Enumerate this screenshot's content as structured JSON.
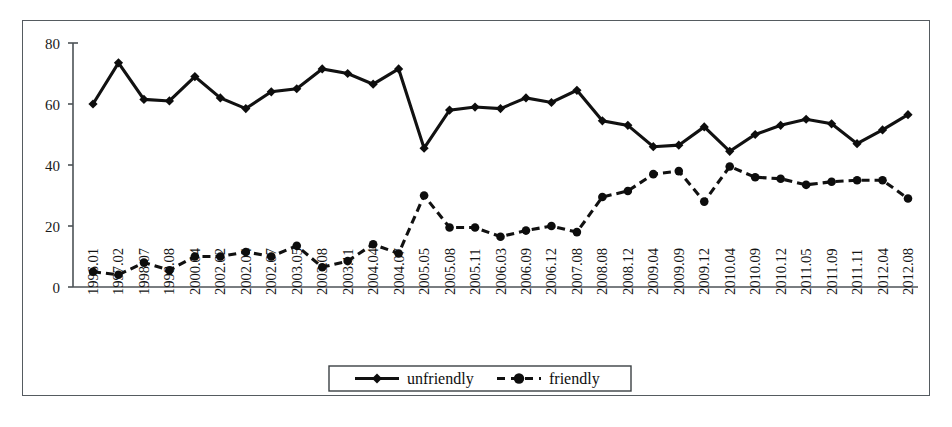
{
  "chart_data": {
    "type": "line",
    "title": "",
    "subtitle": "",
    "xlabel": "",
    "ylabel": "",
    "ylim": [
      0,
      80
    ],
    "yticks": [
      0,
      20,
      40,
      60,
      80
    ],
    "grid": false,
    "legend_position": "bottom",
    "categories": [
      "1996.01",
      "1997.02",
      "1998.07",
      "1998.08",
      "2000.04",
      "2002.02",
      "2002.04",
      "2002.07",
      "2003.05",
      "2003.08",
      "2003.11",
      "2004.04",
      "2004.07",
      "2005.05",
      "2005.08",
      "2005.11",
      "2006.03",
      "2006.09",
      "2006.12",
      "2007.08",
      "2008.08",
      "2008.12",
      "2009.04",
      "2009.09",
      "2009.12",
      "2010.04",
      "2010.09",
      "2010.12",
      "2011.05",
      "2011.09",
      "2011.11",
      "2012.04",
      "2012.08"
    ],
    "series": [
      {
        "name": "unfriendly",
        "line_style": "solid",
        "marker": "diamond",
        "color": "#111111",
        "values": [
          60,
          73.5,
          61.5,
          61,
          69,
          62,
          58.5,
          64,
          65,
          71.5,
          70,
          66.5,
          71.5,
          45.5,
          58,
          59,
          58.5,
          62,
          60.5,
          64.5,
          54.5,
          53,
          46,
          46.5,
          52.5,
          44.5,
          50,
          53,
          55,
          53.5,
          47,
          51.5,
          56.5
        ]
      },
      {
        "name": "friendly",
        "line_style": "dashed",
        "marker": "circle",
        "color": "#111111",
        "values": [
          5,
          4,
          8,
          5.5,
          10,
          10,
          11.5,
          10,
          13.5,
          6.5,
          8.5,
          14,
          11,
          30,
          19.5,
          19.5,
          16.5,
          18.5,
          20,
          18,
          29.5,
          31.5,
          37,
          38,
          28,
          39.5,
          36,
          35.5,
          33.5,
          34.5,
          35,
          35,
          29
        ]
      }
    ]
  },
  "legend": {
    "items": [
      {
        "label": "unfriendly",
        "marker": "diamond",
        "style": "solid"
      },
      {
        "label": "friendly",
        "marker": "circle",
        "style": "dashed"
      }
    ]
  },
  "axes": {
    "y_tick_labels": [
      "80",
      "60",
      "40",
      "20",
      "0"
    ],
    "x_tick_labels": [
      "1996.01",
      "1997.02",
      "1998.07",
      "1998.08",
      "2000.04",
      "2002.02",
      "2002.04",
      "2002.07",
      "2003.05",
      "2003.08",
      "2003.11",
      "2004.04",
      "2004.07",
      "2005.05",
      "2005.08",
      "2005.11",
      "2006.03",
      "2006.09",
      "2006.12",
      "2007.08",
      "2008.08",
      "2008.12",
      "2009.04",
      "2009.09",
      "2009.12",
      "2010.04",
      "2010.09",
      "2010.12",
      "2011.05",
      "2011.09",
      "2011.11",
      "2012.04",
      "2012.08"
    ]
  }
}
